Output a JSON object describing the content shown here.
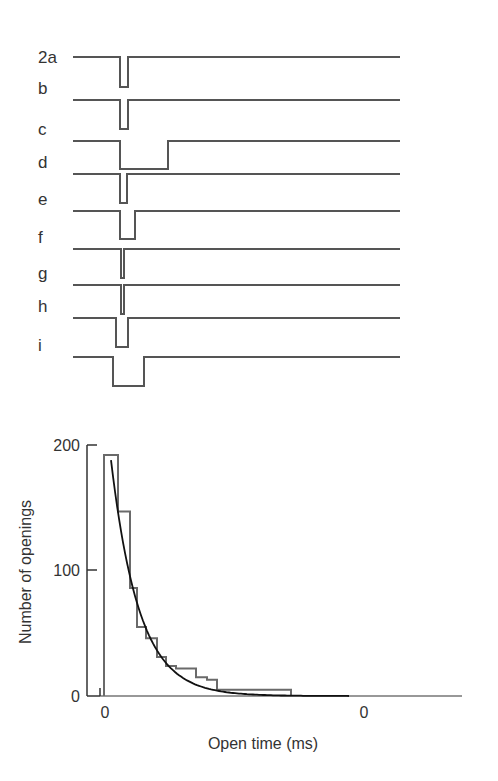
{
  "chart_data": [
    {
      "type": "line",
      "title": "Single-channel current records",
      "description": "Idealized single-channel recording traces; downward deflections are channel openings",
      "traces": [
        {
          "label": "2a",
          "baseline_y": 57,
          "open_start_x": 120,
          "open_end_x": 128,
          "open_depth": 30
        },
        {
          "label": "b",
          "baseline_y": 100,
          "open_start_x": 120,
          "open_end_x": 128,
          "open_depth": 29
        },
        {
          "label": "c",
          "baseline_y": 141,
          "open_start_x": 120,
          "open_end_x": 168,
          "open_depth": 28
        },
        {
          "label": "d",
          "baseline_y": 174,
          "open_start_x": 120,
          "open_end_x": 127,
          "open_depth": 29
        },
        {
          "label": "e",
          "baseline_y": 211,
          "open_start_x": 120,
          "open_end_x": 135,
          "open_depth": 28
        },
        {
          "label": "f",
          "baseline_y": 249,
          "open_start_x": 121,
          "open_end_x": 124,
          "open_depth": 29
        },
        {
          "label": "g",
          "baseline_y": 285,
          "open_start_x": 121,
          "open_end_x": 124,
          "open_depth": 29
        },
        {
          "label": "h",
          "baseline_y": 318,
          "open_start_x": 116,
          "open_end_x": 128,
          "open_depth": 29
        },
        {
          "label": "i",
          "baseline_y": 357,
          "open_start_x": 113,
          "open_end_x": 144,
          "open_depth": 29
        }
      ],
      "trace_x_start": 73,
      "trace_x_end": 400
    },
    {
      "type": "bar",
      "subtype": "histogram_with_exponential_fit",
      "title": "",
      "xlabel": "Open time (ms)",
      "ylabel": "Number of openings",
      "ylim": [
        0,
        200
      ],
      "yticks": [
        0,
        100,
        200
      ],
      "xtick_labels": [
        "0",
        "0"
      ],
      "xtick_positions_px": [
        104,
        364
      ],
      "grid": false,
      "legend": null,
      "bin_edges_px": [
        104,
        118,
        130,
        137,
        146,
        157,
        166,
        176,
        196,
        207,
        217,
        291
      ],
      "values": [
        192,
        147,
        86,
        55,
        46,
        31,
        24,
        22,
        15,
        13,
        5
      ],
      "fit": {
        "type": "exponential_decay",
        "start_value": 188,
        "start_x_px": 111,
        "end_x_px": 350,
        "tau_px": 28
      }
    }
  ],
  "labels": {
    "y_axis_title": "Number of openings",
    "x_axis_title": "Open time (ms)",
    "ytick_0": "0",
    "ytick_100": "100",
    "ytick_200": "200",
    "xtick_a": "0",
    "xtick_b": "0"
  },
  "colors": {
    "trace": "#555555",
    "histogram": "#6a6a6a",
    "fit_curve": "#111111",
    "axis": "#333333",
    "text": "#333333"
  }
}
